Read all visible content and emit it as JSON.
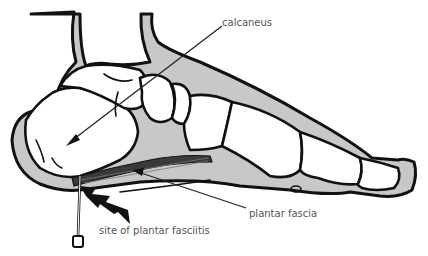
{
  "labels": {
    "calcaneus": "calcaneus",
    "plantar_fascia": "plantar fascia",
    "site": "site of plantar fasciitis"
  },
  "colors": {
    "outline": "#111111",
    "soft_tissue": "#c8c8c8",
    "bone": "#ffffff",
    "label_text": "#555555",
    "fascia": "#3a3a3a"
  }
}
